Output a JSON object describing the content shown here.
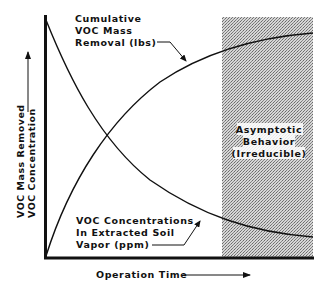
{
  "diagram": {
    "type": "conceptual-curve-plot",
    "y_axis": {
      "label_line1": "VOC Mass Removed",
      "label_line2": "VOC Concentration"
    },
    "x_axis": {
      "label": "Operation Time"
    },
    "curves": [
      {
        "name": "cumulative-voc-mass-removal",
        "label_line1": "Cumulative",
        "label_line2": "VOC Mass",
        "label_line3": "Removal (lbs)",
        "trend": "increasing-asymptotic"
      },
      {
        "name": "voc-concentrations",
        "label_line1": "VOC Concentrations",
        "label_line2": "In Extracted Soil",
        "label_line3": "Vapor (ppm)",
        "trend": "decreasing-asymptotic"
      }
    ],
    "region": {
      "label_line1": "Asymptotic",
      "label_line2": "Behavior",
      "label_line3": "(Irreducible)",
      "fill": "#b8b8b8"
    },
    "colors": {
      "ink": "#111111",
      "background": "#ffffff"
    }
  }
}
